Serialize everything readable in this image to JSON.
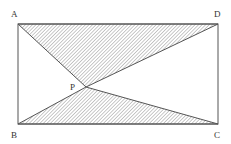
{
  "diagram": {
    "type": "geometry",
    "points": {
      "A": {
        "label": "A",
        "x": 18,
        "y": 24
      },
      "B": {
        "label": "B",
        "x": 18,
        "y": 124
      },
      "C": {
        "label": "C",
        "x": 218,
        "y": 124
      },
      "D": {
        "label": "D",
        "x": 218,
        "y": 24
      },
      "P": {
        "label": "P",
        "x": 86,
        "y": 87
      }
    },
    "shaded_regions": [
      "APD",
      "BPC"
    ],
    "colors": {
      "stroke": "#555555",
      "hatch": "#777777",
      "label": "#333333"
    }
  }
}
